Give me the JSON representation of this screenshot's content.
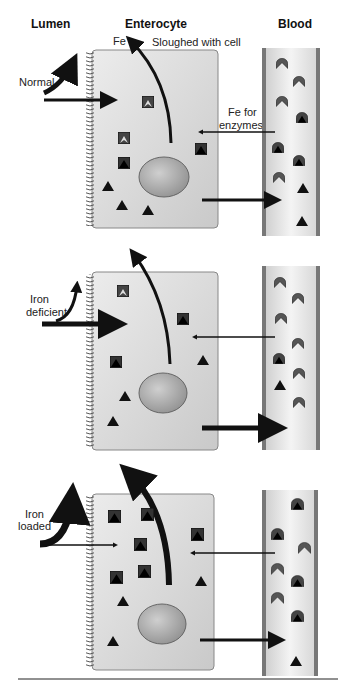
{
  "headers": {
    "lumen": "Lumen",
    "enterocyte": "Enterocyte",
    "blood": "Blood"
  },
  "labels": {
    "fe": "Fe",
    "sloughed": "Sloughed with cell",
    "fe_for": "Fe for",
    "enzymes": "enzymes"
  },
  "panels": [
    {
      "state": "Normal",
      "state_line2": ""
    },
    {
      "state": "Iron",
      "state_line2": "deficient"
    },
    {
      "state": "Iron",
      "state_line2": "loaded"
    }
  ],
  "colors": {
    "cell_fill": "#d9d9d9",
    "vessel_wall": "#777777",
    "shape": "#111111",
    "transferrin": "#555555"
  }
}
